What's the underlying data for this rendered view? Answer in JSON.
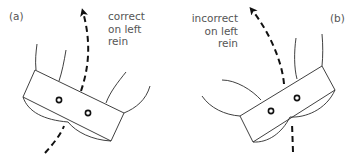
{
  "figure": {
    "panels": [
      {
        "id": "a",
        "caption": "(a)",
        "note_lines": [
          "correct",
          "on left",
          "rein"
        ],
        "arrow_direction": "up-left curving, passing through box centre"
      },
      {
        "id": "b",
        "caption": "(b)",
        "note_lines": [
          "incorrect",
          "on left",
          "rein"
        ],
        "arrow_direction": "up-left curving, entering box off-centre"
      }
    ],
    "colors": {
      "line": "#2a2a2a",
      "dash": "#111111",
      "text": "#555555",
      "background": "#ffffff"
    }
  }
}
